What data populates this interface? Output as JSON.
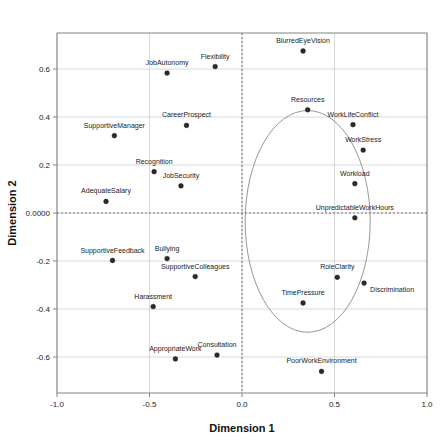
{
  "chart_data": {
    "type": "scatter",
    "title": "",
    "xlabel": "Dimension 1",
    "ylabel": "Dimension 2",
    "xlim": [
      -1.0,
      1.0
    ],
    "ylim": [
      -0.75,
      0.75
    ],
    "xticks": [
      "-1.0",
      "-0.5",
      "0.0",
      "0.5",
      "1.0"
    ],
    "xtick_values": [
      -1.0,
      -0.5,
      0.0,
      0.5,
      1.0
    ],
    "yticks": [
      "0.6",
      "0.4",
      "0.2",
      "0.0000",
      "-0.2",
      "-0.4",
      "-0.6"
    ],
    "ytick_values": [
      0.6,
      0.4,
      0.2,
      0.0,
      -0.2,
      -0.4,
      -0.6
    ],
    "grid": true,
    "legend": "none",
    "reference_lines": {
      "vertical_x": 0.0,
      "horizontal_y": 0.0,
      "style": "dashed"
    },
    "annotation_ellipse": {
      "center_x": 0.355,
      "center_y": -0.035,
      "radius_x": 0.338,
      "radius_y": 0.462,
      "style": "solid-outline"
    },
    "points": [
      {
        "label": "JobAutonomy",
        "x": -0.405,
        "y": 0.583,
        "label_dx": 0,
        "label_dy": -8
      },
      {
        "label": "Flexibility",
        "x": -0.145,
        "y": 0.61,
        "label_dx": 0,
        "label_dy": -8
      },
      {
        "label": "BlurredEyeVision",
        "x": 0.33,
        "y": 0.675,
        "label_dx": 0,
        "label_dy": -8
      },
      {
        "label": "CareerProspect",
        "x": -0.3,
        "y": 0.365,
        "label_dx": 0,
        "label_dy": -8
      },
      {
        "label": "Resources",
        "x": 0.355,
        "y": 0.43,
        "label_dx": 0,
        "label_dy": -8
      },
      {
        "label": "WorkLifeConflict",
        "x": 0.6,
        "y": 0.368,
        "label_dx": 0,
        "label_dy": -8
      },
      {
        "label": "SupportiveManager",
        "x": -0.69,
        "y": 0.322,
        "label_dx": 0,
        "label_dy": -8
      },
      {
        "label": "WorkStress",
        "x": 0.655,
        "y": 0.262,
        "label_dx": 0,
        "label_dy": -8
      },
      {
        "label": "Recognition",
        "x": -0.475,
        "y": 0.172,
        "label_dx": 0,
        "label_dy": -8
      },
      {
        "label": "JobSecurity",
        "x": -0.33,
        "y": 0.113,
        "label_dx": 0,
        "label_dy": -8
      },
      {
        "label": "Workload",
        "x": 0.61,
        "y": 0.122,
        "label_dx": 0,
        "label_dy": -8
      },
      {
        "label": "AdequateSalary",
        "x": -0.735,
        "y": 0.048,
        "label_dx": 0,
        "label_dy": -8
      },
      {
        "label": "UnpredictableWorkHours",
        "x": 0.61,
        "y": -0.02,
        "label_dx": 0,
        "label_dy": -8
      },
      {
        "label": "SupportiveFeedback",
        "x": -0.7,
        "y": -0.198,
        "label_dx": 0,
        "label_dy": -8
      },
      {
        "label": "Bullying",
        "x": -0.405,
        "y": -0.19,
        "label_dx": 0,
        "label_dy": -8
      },
      {
        "label": "SupportiveColleagues",
        "x": -0.253,
        "y": -0.265,
        "label_dx": 0,
        "label_dy": -8
      },
      {
        "label": "RoleClarity",
        "x": 0.515,
        "y": -0.268,
        "label_dx": 0,
        "label_dy": -8
      },
      {
        "label": "Discrimination",
        "x": 0.66,
        "y": -0.292,
        "label_dx": 6,
        "label_dy": 9
      },
      {
        "label": "Harassment",
        "x": -0.48,
        "y": -0.39,
        "label_dx": 0,
        "label_dy": -8
      },
      {
        "label": "TimePressure",
        "x": 0.33,
        "y": -0.375,
        "label_dx": 0,
        "label_dy": -8
      },
      {
        "label": "AppropriateWork",
        "x": -0.36,
        "y": -0.608,
        "label_dx": 0,
        "label_dy": -8
      },
      {
        "label": "Consultation",
        "x": -0.135,
        "y": -0.592,
        "label_dx": 0,
        "label_dy": -8
      },
      {
        "label": "PoorWorkEnvironment",
        "x": 0.43,
        "y": -0.66,
        "label_dx": 0,
        "label_dy": -8
      }
    ]
  }
}
